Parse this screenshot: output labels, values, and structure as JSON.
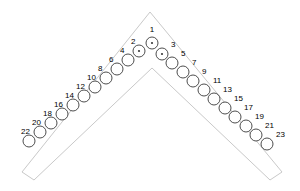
{
  "figure": {
    "outline_color": "#c9c9c9",
    "hole_stroke_color": "#3a3a3a",
    "label_color": "#000000",
    "background_color": "#ffffff",
    "hole_radius": 6,
    "dot_radius": 1.1,
    "total_holes": 23
  },
  "chart_data": {
    "type": "scatter",
    "xlabel": "",
    "ylabel": "",
    "xlim": [
      0,
      300
    ],
    "ylim": [
      0,
      191
    ],
    "grid": false,
    "legend": "none",
    "annotations": [
      "Holes 1, 2 and 3 are marked with a center dot",
      "Odd-numbered holes descend the right arm",
      "Even-numbered holes descend the left arm"
    ],
    "series": [
      {
        "name": "holes",
        "points": [
          {
            "label": "1",
            "x": 152,
            "y": 43,
            "dot": true,
            "label_x": 152,
            "label_y": 30,
            "label_anchor": "center"
          },
          {
            "label": "2",
            "x": 139,
            "y": 51,
            "dot": true,
            "label_x": 131,
            "label_y": 42,
            "label_anchor": "right"
          },
          {
            "label": "3",
            "x": 162,
            "y": 54,
            "dot": true,
            "label_x": 171,
            "label_y": 45,
            "label_anchor": "right"
          },
          {
            "label": "4",
            "x": 128,
            "y": 60,
            "dot": false,
            "label_x": 120,
            "label_y": 51,
            "label_anchor": "right"
          },
          {
            "label": "5",
            "x": 172,
            "y": 63,
            "dot": false,
            "label_x": 181,
            "label_y": 54,
            "label_anchor": "right"
          },
          {
            "label": "6",
            "x": 117,
            "y": 69,
            "dot": false,
            "label_x": 109,
            "label_y": 60,
            "label_anchor": "right"
          },
          {
            "label": "7",
            "x": 183,
            "y": 72,
            "dot": false,
            "label_x": 192,
            "label_y": 63,
            "label_anchor": "right"
          },
          {
            "label": "8",
            "x": 106,
            "y": 78,
            "dot": false,
            "label_x": 98,
            "label_y": 69,
            "label_anchor": "right"
          },
          {
            "label": "9",
            "x": 193,
            "y": 81,
            "dot": false,
            "label_x": 202,
            "label_y": 72,
            "label_anchor": "right"
          },
          {
            "label": "10",
            "x": 95,
            "y": 87,
            "dot": false,
            "label_x": 87,
            "label_y": 78,
            "label_anchor": "right"
          },
          {
            "label": "11",
            "x": 204,
            "y": 90,
            "dot": false,
            "label_x": 213,
            "label_y": 81,
            "label_anchor": "right"
          },
          {
            "label": "12",
            "x": 84,
            "y": 96,
            "dot": false,
            "label_x": 76,
            "label_y": 87,
            "label_anchor": "right"
          },
          {
            "label": "13",
            "x": 214,
            "y": 99,
            "dot": false,
            "label_x": 223,
            "label_y": 90,
            "label_anchor": "right"
          },
          {
            "label": "14",
            "x": 73,
            "y": 105,
            "dot": false,
            "label_x": 65,
            "label_y": 96,
            "label_anchor": "right"
          },
          {
            "label": "15",
            "x": 225,
            "y": 108,
            "dot": false,
            "label_x": 234,
            "label_y": 99,
            "label_anchor": "right"
          },
          {
            "label": "16",
            "x": 62,
            "y": 114,
            "dot": false,
            "label_x": 54,
            "label_y": 105,
            "label_anchor": "right"
          },
          {
            "label": "17",
            "x": 235,
            "y": 117,
            "dot": false,
            "label_x": 244,
            "label_y": 108,
            "label_anchor": "right"
          },
          {
            "label": "18",
            "x": 51,
            "y": 123,
            "dot": false,
            "label_x": 43,
            "label_y": 114,
            "label_anchor": "right"
          },
          {
            "label": "19",
            "x": 246,
            "y": 126,
            "dot": false,
            "label_x": 255,
            "label_y": 117,
            "label_anchor": "right"
          },
          {
            "label": "20",
            "x": 40,
            "y": 132,
            "dot": false,
            "label_x": 32,
            "label_y": 123,
            "label_anchor": "right"
          },
          {
            "label": "21",
            "x": 256,
            "y": 135,
            "dot": false,
            "label_x": 265,
            "label_y": 126,
            "label_anchor": "right"
          },
          {
            "label": "22",
            "x": 29,
            "y": 141,
            "dot": false,
            "label_x": 21,
            "label_y": 132,
            "label_anchor": "right"
          },
          {
            "label": "23",
            "x": 267,
            "y": 144,
            "dot": false,
            "label_x": 276,
            "label_y": 135,
            "label_anchor": "right"
          }
        ]
      }
    ],
    "outline": {
      "name": "chevron-plate-outline",
      "points": "150,12 282,172 270,180 152,68 34,180 22,172"
    }
  }
}
